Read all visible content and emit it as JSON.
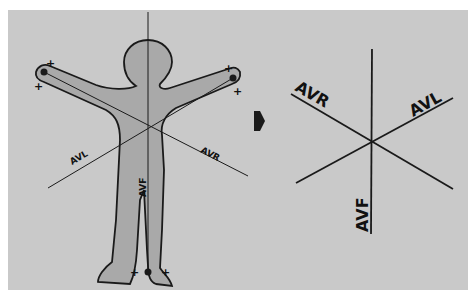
{
  "figure": {
    "left_panel": {
      "leads": [
        {
          "label": "AVL",
          "position": "left lower line"
        },
        {
          "label": "AVR",
          "position": "right lower line"
        },
        {
          "label": "AVF",
          "position": "vertical body line"
        }
      ],
      "electrode_marks": [
        "+",
        "+",
        "+",
        "+",
        "+",
        "+"
      ]
    },
    "arrow": "right-arrow",
    "right_panel": {
      "leads": [
        {
          "label": "AVR"
        },
        {
          "label": "AVL"
        },
        {
          "label": "AVF"
        }
      ]
    },
    "colors": {
      "background": "#c9c9c9",
      "body_fill": "#a9a9a9",
      "line": "#1a1a1a"
    }
  }
}
